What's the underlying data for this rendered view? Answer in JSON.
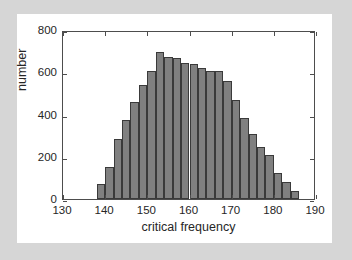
{
  "figure": {
    "background_color": "#ffffff",
    "page_background_color": "#d6d6d6",
    "axis_color": "#4d4d4d",
    "bar_fill_color": "#808080",
    "bar_edge_color": "#3a3a3a"
  },
  "chart_data": {
    "type": "bar",
    "title": "",
    "xlabel": "critical frequency",
    "ylabel": "number",
    "xlim": [
      130,
      190
    ],
    "ylim": [
      0,
      800
    ],
    "xticks": [
      130,
      140,
      150,
      160,
      170,
      180,
      190
    ],
    "yticks": [
      0,
      200,
      400,
      600,
      800
    ],
    "xtick_labels": [
      "130",
      "140",
      "150",
      "160",
      "170",
      "180",
      "190"
    ],
    "ytick_labels": [
      "0",
      "200",
      "400",
      "600",
      "800"
    ],
    "grid": false,
    "legend": null,
    "bin_width": 2,
    "bin_starts": [
      138,
      140,
      142,
      144,
      146,
      148,
      150,
      152,
      154,
      156,
      158,
      160,
      162,
      164,
      166,
      168,
      170,
      172,
      174,
      176,
      178,
      180,
      182,
      184
    ],
    "categories": [
      "138-140",
      "140-142",
      "142-144",
      "144-146",
      "146-148",
      "148-150",
      "150-152",
      "152-154",
      "154-156",
      "156-158",
      "158-160",
      "160-162",
      "162-164",
      "164-166",
      "166-168",
      "168-170",
      "170-172",
      "172-174",
      "174-176",
      "176-178",
      "178-180",
      "180-182",
      "182-184",
      "184-186"
    ],
    "values": [
      70,
      152,
      283,
      373,
      460,
      541,
      607,
      694,
      672,
      669,
      643,
      637,
      620,
      607,
      607,
      558,
      470,
      382,
      310,
      244,
      209,
      124,
      80,
      38
    ]
  }
}
